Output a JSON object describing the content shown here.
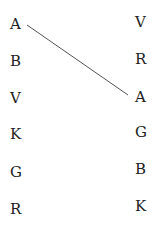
{
  "left_column": [
    "A",
    "B",
    "V",
    "K",
    "G",
    "R"
  ],
  "right_column": [
    "V",
    "R",
    "A",
    "G",
    "B",
    "K"
  ],
  "connections": [
    {
      "from": "left.0",
      "to": "right.2",
      "from_label": "A",
      "to_label": "A"
    }
  ],
  "line_color": "#555555"
}
